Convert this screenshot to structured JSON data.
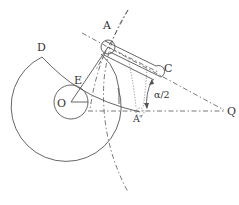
{
  "diagram": {
    "type": "mechanism-geometry",
    "labels": {
      "A": "A",
      "C": "C",
      "D": "D",
      "E": "E",
      "O": "O",
      "A_prime": "A'",
      "Q": "Q",
      "angle": "α/2"
    },
    "points": {
      "O": [
        71,
        102
      ],
      "A": [
        108,
        47
      ],
      "C": [
        158,
        72
      ],
      "D": [
        42,
        57
      ],
      "E": [
        79,
        88
      ],
      "A_prime": [
        140,
        112
      ],
      "Q": [
        226,
        111
      ]
    },
    "colors": {
      "stroke": "#555555",
      "text": "#333333",
      "background": "#ffffff"
    }
  }
}
